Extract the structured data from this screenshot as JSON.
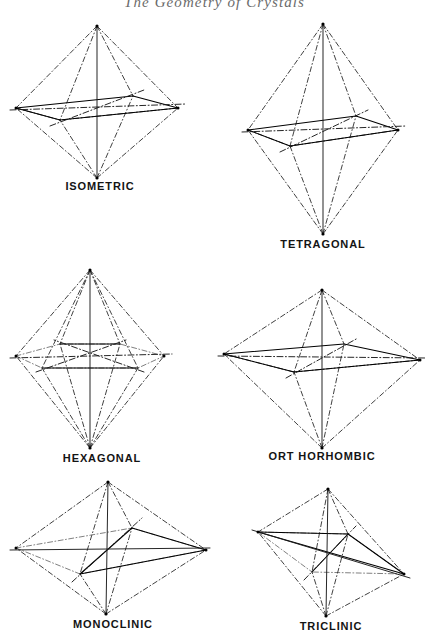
{
  "page": {
    "running_head": "The Geometry of Crystals",
    "background_color": "#ffffff",
    "ink_color": "#000000",
    "width": 429,
    "height": 641
  },
  "figures": [
    {
      "id": "isometric",
      "label": "ISOMETRIC",
      "description": "Octahedron with three equal crystallographic axes at right angles",
      "axes_count": 3,
      "relative_height": "equal",
      "relative_width": "equal"
    },
    {
      "id": "tetragonal",
      "label": "TETRAGONAL",
      "description": "Elongated square bipyramid, vertical axis longer than the two equal horizontal axes",
      "axes_count": 3,
      "relative_height": "tall",
      "relative_width": "narrow"
    },
    {
      "id": "hexagonal",
      "label": "HEXAGONAL",
      "description": "Hexagonal bipyramid with three equal horizontal axes at 120 degrees plus a vertical axis",
      "axes_count": 4,
      "relative_height": "tall",
      "relative_width": "wide"
    },
    {
      "id": "orthorhombic",
      "label": "ORT HORHOMBIC",
      "description": "Rhombic bipyramid with three unequal axes at right angles",
      "axes_count": 3,
      "relative_height": "short",
      "relative_width": "wide"
    },
    {
      "id": "monoclinic",
      "label": "MONOCLINIC",
      "description": "Bipyramid with three unequal axes, one inclined",
      "axes_count": 3,
      "relative_height": "medium",
      "relative_width": "wide"
    },
    {
      "id": "triclinic",
      "label": "TRICLINIC",
      "description": "Bipyramid with three unequal axes, none at right angles",
      "axes_count": 3,
      "relative_height": "medium",
      "relative_width": "medium"
    }
  ]
}
